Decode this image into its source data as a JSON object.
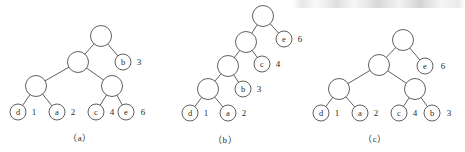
{
  "figure": {
    "kind": "huffman-tree-construction-stages",
    "panel_count": 3,
    "stroke_color": "#4e4e4e",
    "text_color": "#2b2b2b",
    "background_color": "#ffffff"
  },
  "captions": [
    {
      "id": "caption-a",
      "text": "（a）",
      "x": 80,
      "y": 138
    },
    {
      "id": "caption-b",
      "text": "（b）",
      "x": 225,
      "y": 140
    },
    {
      "id": "caption-c",
      "text": "（c）",
      "x": 375,
      "y": 139
    }
  ],
  "panels": [
    {
      "id": "panel-a",
      "caption": "（a）",
      "nodes": [
        {
          "id": "a-root",
          "letter": "",
          "weight": "",
          "cx": 101,
          "cy": 36,
          "r": 10.5,
          "labeled": false
        },
        {
          "id": "a-n1",
          "letter": "",
          "weight": "",
          "cx": 78,
          "cy": 62,
          "r": 10.5,
          "labeled": false
        },
        {
          "id": "a-b",
          "letter": "b",
          "weight": "3",
          "cx": 123,
          "cy": 62,
          "r": 8.0,
          "labeled": true,
          "weight_x": 139,
          "weight_y": 62
        },
        {
          "id": "a-n2",
          "letter": "",
          "weight": "",
          "cx": 36,
          "cy": 86,
          "r": 10.5,
          "labeled": false
        },
        {
          "id": "a-n3",
          "letter": "",
          "weight": "",
          "cx": 112,
          "cy": 86,
          "r": 10.5,
          "labeled": false
        },
        {
          "id": "a-d",
          "letter": "d",
          "weight": "1",
          "cx": 18,
          "cy": 112,
          "r": 8.0,
          "labeled": true,
          "weight_x": 34,
          "weight_y": 112
        },
        {
          "id": "a-a",
          "letter": "a",
          "weight": "2",
          "cx": 57,
          "cy": 112,
          "r": 8.0,
          "labeled": true,
          "weight_x": 73,
          "weight_y": 112
        },
        {
          "id": "a-c",
          "letter": "c",
          "weight": "4",
          "cx": 96,
          "cy": 112,
          "r": 8.0,
          "labeled": true,
          "weight_x": 112,
          "weight_y": 112
        },
        {
          "id": "a-e",
          "letter": "e",
          "weight": "6",
          "cx": 126,
          "cy": 112,
          "r": 8.0,
          "labeled": true,
          "weight_x": 143,
          "weight_y": 112
        }
      ],
      "edges": [
        {
          "from": "a-root",
          "to": "a-n1"
        },
        {
          "from": "a-root",
          "to": "a-b"
        },
        {
          "from": "a-n1",
          "to": "a-n2"
        },
        {
          "from": "a-n1",
          "to": "a-n3"
        },
        {
          "from": "a-n2",
          "to": "a-d"
        },
        {
          "from": "a-n2",
          "to": "a-a"
        },
        {
          "from": "a-n3",
          "to": "a-c"
        },
        {
          "from": "a-n3",
          "to": "a-e"
        }
      ]
    },
    {
      "id": "panel-b",
      "caption": "（b）",
      "nodes": [
        {
          "id": "b-root",
          "letter": "",
          "weight": "",
          "cx": 263,
          "cy": 16,
          "r": 10.5,
          "labeled": false
        },
        {
          "id": "b-n1",
          "letter": "",
          "weight": "",
          "cx": 246,
          "cy": 42,
          "r": 10.5,
          "labeled": false
        },
        {
          "id": "b-e",
          "letter": "e",
          "weight": "6",
          "cx": 284,
          "cy": 39,
          "r": 8.0,
          "labeled": true,
          "weight_x": 300,
          "weight_y": 39
        },
        {
          "id": "b-n2",
          "letter": "",
          "weight": "",
          "cx": 228,
          "cy": 66,
          "r": 10.5,
          "labeled": false
        },
        {
          "id": "b-c",
          "letter": "c",
          "weight": "4",
          "cx": 262,
          "cy": 64,
          "r": 8.0,
          "labeled": true,
          "weight_x": 278,
          "weight_y": 64
        },
        {
          "id": "b-n3",
          "letter": "",
          "weight": "",
          "cx": 208,
          "cy": 89,
          "r": 10.5,
          "labeled": false
        },
        {
          "id": "b-b",
          "letter": "b",
          "weight": "3",
          "cx": 243,
          "cy": 89,
          "r": 8.0,
          "labeled": true,
          "weight_x": 259,
          "weight_y": 89
        },
        {
          "id": "b-d",
          "letter": "d",
          "weight": "1",
          "cx": 190,
          "cy": 113,
          "r": 8.0,
          "labeled": true,
          "weight_x": 206,
          "weight_y": 113
        },
        {
          "id": "b-a",
          "letter": "a",
          "weight": "2",
          "cx": 228,
          "cy": 113,
          "r": 8.0,
          "labeled": true,
          "weight_x": 244,
          "weight_y": 113
        }
      ],
      "edges": [
        {
          "from": "b-root",
          "to": "b-n1"
        },
        {
          "from": "b-root",
          "to": "b-e"
        },
        {
          "from": "b-n1",
          "to": "b-n2"
        },
        {
          "from": "b-n1",
          "to": "b-c"
        },
        {
          "from": "b-n2",
          "to": "b-n3"
        },
        {
          "from": "b-n2",
          "to": "b-b"
        },
        {
          "from": "b-n3",
          "to": "b-d"
        },
        {
          "from": "b-n3",
          "to": "b-a"
        }
      ]
    },
    {
      "id": "panel-c",
      "caption": "（c）",
      "nodes": [
        {
          "id": "c-root",
          "letter": "",
          "weight": "",
          "cx": 403,
          "cy": 40,
          "r": 10.5,
          "labeled": false
        },
        {
          "id": "c-n1",
          "letter": "",
          "weight": "",
          "cx": 379,
          "cy": 65,
          "r": 10.5,
          "labeled": false
        },
        {
          "id": "c-e",
          "letter": "e",
          "weight": "6",
          "cx": 425,
          "cy": 66,
          "r": 8.0,
          "labeled": true,
          "weight_x": 443,
          "weight_y": 66
        },
        {
          "id": "c-n2",
          "letter": "",
          "weight": "",
          "cx": 339,
          "cy": 89,
          "r": 10.5,
          "labeled": false
        },
        {
          "id": "c-n3",
          "letter": "",
          "weight": "",
          "cx": 415,
          "cy": 89,
          "r": 10.5,
          "labeled": false
        },
        {
          "id": "c-d",
          "letter": "d",
          "weight": "1",
          "cx": 321,
          "cy": 113,
          "r": 8.0,
          "labeled": true,
          "weight_x": 337,
          "weight_y": 113
        },
        {
          "id": "c-a",
          "letter": "a",
          "weight": "2",
          "cx": 360,
          "cy": 113,
          "r": 8.0,
          "labeled": true,
          "weight_x": 376,
          "weight_y": 113
        },
        {
          "id": "c-c",
          "letter": "c",
          "weight": "4",
          "cx": 399,
          "cy": 113,
          "r": 8.0,
          "labeled": true,
          "weight_x": 415,
          "weight_y": 113
        },
        {
          "id": "c-b",
          "letter": "b",
          "weight": "3",
          "cx": 432,
          "cy": 113,
          "r": 8.0,
          "labeled": true,
          "weight_x": 449,
          "weight_y": 113
        }
      ],
      "edges": [
        {
          "from": "c-root",
          "to": "c-n1"
        },
        {
          "from": "c-root",
          "to": "c-e"
        },
        {
          "from": "c-n1",
          "to": "c-n2"
        },
        {
          "from": "c-n1",
          "to": "c-n3"
        },
        {
          "from": "c-n2",
          "to": "c-d"
        },
        {
          "from": "c-n2",
          "to": "c-a"
        },
        {
          "from": "c-n3",
          "to": "c-c"
        },
        {
          "from": "c-n3",
          "to": "c-b"
        }
      ]
    }
  ]
}
